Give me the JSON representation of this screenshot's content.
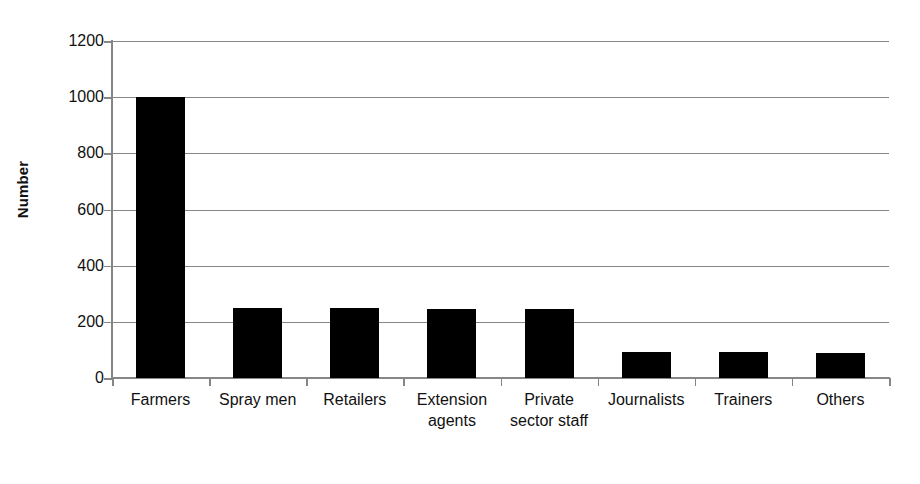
{
  "chart_data": {
    "type": "bar",
    "title": "",
    "subtitle": "",
    "xlabel": "",
    "ylabel": "Number",
    "categories": [
      "Farmers",
      "Spray men",
      "Retailers",
      "Extension agents",
      "Private sector staff",
      "Journalists",
      "Trainers",
      "Others"
    ],
    "values": [
      1000,
      250,
      250,
      247,
      245,
      92,
      92,
      90
    ],
    "ylim": [
      0,
      1200
    ],
    "yticks": [
      0,
      200,
      400,
      600,
      800,
      1000,
      1200
    ],
    "ytick_labels": [
      "0",
      "200",
      "400",
      "600",
      "800",
      "1000",
      "1200"
    ],
    "grid": true,
    "grid_axis": "y",
    "legend": false,
    "legend_position": "none",
    "bar_color": "#000000",
    "axis_color": "#868686",
    "background_color": "#ffffff",
    "series": [
      {
        "name": "Number",
        "values": [
          1000,
          250,
          250,
          247,
          245,
          92,
          92,
          90
        ]
      }
    ]
  },
  "axis": {
    "y_title": "Number"
  },
  "colors": {
    "bar": "#000000",
    "grid": "#868686",
    "axis": "#868686",
    "text": "#111111",
    "background": "#ffffff"
  }
}
